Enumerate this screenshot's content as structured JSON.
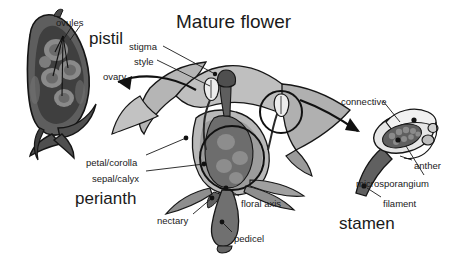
{
  "figure": {
    "title": "Mature flower",
    "background_color": "#ffffff",
    "ink_color": "#1a1a1a"
  },
  "palette": {
    "outline": "#141414",
    "tissue_light": "#c9c9c9",
    "tissue_mid": "#a6a6a6",
    "tissue_dark": "#6e6e6e",
    "organ_dark": "#5a5a5a",
    "ovary_fill": "#767676",
    "anther_light": "#e2e2e2",
    "pollen": "#707070",
    "white": "#ffffff"
  },
  "titles": [
    {
      "id": "mature-flower",
      "text": "Mature flower",
      "x": 176,
      "y": 12,
      "size": "title"
    },
    {
      "id": "pistil",
      "text": "pistil",
      "x": 89,
      "y": 30,
      "size": "big"
    },
    {
      "id": "perianth",
      "text": "perianth",
      "x": 75,
      "y": 190,
      "size": "big"
    },
    {
      "id": "stamen",
      "text": "stamen",
      "x": 339,
      "y": 215,
      "size": "big"
    }
  ],
  "labels": [
    {
      "id": "ovules",
      "text": "ovules",
      "x": 56,
      "y": 18,
      "anchor": "start"
    },
    {
      "id": "stigma",
      "text": "stigma",
      "x": 129,
      "y": 42,
      "anchor": "start"
    },
    {
      "id": "style",
      "text": "style",
      "x": 134,
      "y": 57,
      "anchor": "start"
    },
    {
      "id": "ovary",
      "text": "ovary",
      "x": 103,
      "y": 72,
      "anchor": "start"
    },
    {
      "id": "connective",
      "text": "connective",
      "x": 341,
      "y": 97,
      "anchor": "start"
    },
    {
      "id": "petal-corolla",
      "text": "petal/corolla",
      "x": 86,
      "y": 158,
      "anchor": "start"
    },
    {
      "id": "sepal-calyx",
      "text": "sepal/calyx",
      "x": 92,
      "y": 174,
      "anchor": "start"
    },
    {
      "id": "anther",
      "text": "anther",
      "x": 414,
      "y": 161,
      "anchor": "start"
    },
    {
      "id": "microsporangium",
      "text": "microsporangium",
      "x": 356,
      "y": 179,
      "anchor": "start"
    },
    {
      "id": "floral-axis",
      "text": "floral axis",
      "x": 241,
      "y": 199,
      "anchor": "start"
    },
    {
      "id": "filament",
      "text": "filament",
      "x": 383,
      "y": 199,
      "anchor": "start"
    },
    {
      "id": "nectary",
      "text": "nectary",
      "x": 157,
      "y": 216,
      "anchor": "start"
    },
    {
      "id": "pedicel",
      "text": "pedicel",
      "x": 234,
      "y": 234,
      "anchor": "start"
    }
  ],
  "parts": [
    {
      "id": "pistil-blowup",
      "name": "pistil longitudinal section",
      "labels": [
        "ovules",
        "ovary"
      ]
    },
    {
      "id": "flower-center",
      "name": "mature flower section",
      "labels": [
        "stigma",
        "style",
        "petal/corolla",
        "sepal/calyx",
        "floral axis",
        "nectary",
        "pedicel"
      ]
    },
    {
      "id": "stamen-blowup",
      "name": "stamen detail",
      "labels": [
        "connective",
        "anther",
        "microsporangium",
        "filament"
      ]
    }
  ]
}
